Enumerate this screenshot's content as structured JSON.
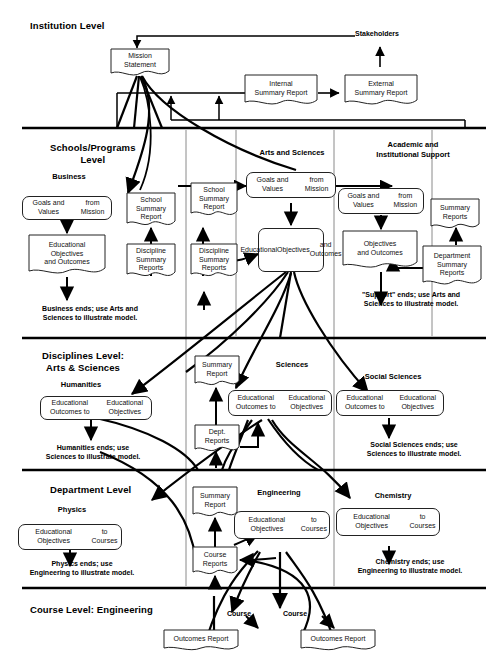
{
  "diagram": {
    "levels": [
      {
        "id": "institution",
        "label": "Institution Level"
      },
      {
        "id": "schools",
        "label": "Schools/Programs\nLevel",
        "line1": "Schools/Programs",
        "line2": "Level"
      },
      {
        "id": "disciplines",
        "label": "Disciplines Level:\nArts & Sciences",
        "line1": "Disciplines Level:",
        "line2": "Arts & Sciences"
      },
      {
        "id": "department",
        "label": "Department Level"
      },
      {
        "id": "course",
        "label": "Course Level:  Engineering"
      }
    ],
    "columns": [
      {
        "id": "business",
        "label": "Business"
      },
      {
        "id": "arts-and-sciences",
        "label": "Arts and Sciences"
      },
      {
        "id": "academic-support",
        "line1": "Academic and",
        "line2": "Institutional Support"
      },
      {
        "id": "humanities",
        "label": "Humanities"
      },
      {
        "id": "sciences",
        "label": "Sciences"
      },
      {
        "id": "social-sciences",
        "label": "Social Sciences"
      },
      {
        "id": "physics",
        "label": "Physics"
      },
      {
        "id": "engineering",
        "label": "Engineering"
      },
      {
        "id": "chemistry",
        "label": "Chemistry"
      }
    ],
    "nodes": {
      "mission_statement": "Mission\nStatement",
      "internal_summary_report": "Internal\nSummary Report",
      "external_summary_report": "External\nSummary Report",
      "business_goals": "Goals and Values\nfrom Mission",
      "business_school_summary": "School\nSummary\nReport",
      "business_edu_obj": "Educational\nObjectives\nand Outcomes",
      "business_discipline_summary": "Discipline\nSummary\nReports",
      "as_school_summary": "School\nSummary\nReport",
      "as_goals": "Goals and Values\nfrom Mission",
      "as_discipline_summary": "Discipline\nSummary\nReports",
      "as_edu_obj": "Educational\nObjectives\nand Outcomes",
      "sup_goals": "Goals and Values\nfrom Mission",
      "sup_summary_reports": "Summary\nReports",
      "sup_objectives": "Objectives\nand Outcomes",
      "sup_dept_summary": "Department\nSummary\nReports",
      "hum_outcomes": "Educational Outcomes to\nEducational Objectives",
      "sci_summary_report": "Summary\nReport",
      "sci_dept_reports": "Dept.\nReports",
      "sci_outcomes": "Educational Outcomes to\nEducational Objectives",
      "soc_outcomes": "Educational Outcomes to\nEducational Objectives",
      "phys_obj_courses": "Educational Objectives\nto Courses",
      "eng_summary_report": "Summary\nReport",
      "eng_course_reports": "Course\nReports",
      "eng_obj_courses": "Educational Objectives\nto Courses",
      "chem_obj_courses": "Educational Objectives\nto Courses",
      "outcomes_report_left": "Outcomes Report",
      "outcomes_report_right": "Outcomes Report"
    },
    "edge_labels": {
      "stakeholders": "Stakeholders",
      "course_left": "Course",
      "course_right": "Course"
    },
    "notes": {
      "business": "Business ends; use Arts and\nSciences to illustrate model.",
      "support": "\"Support\" ends; use Arts and\nSciences to illustrate model.",
      "humanities": "Humanities ends; use\nSciences to illustrate model.",
      "social_sciences": "Social Sciences ends; use\nSciences to illustrate model.",
      "physics": "Physics ends; use\nEngineering to illustrate model.",
      "chemistry": "Chemistry ends; use\nEngineering to illustrate model."
    },
    "colors": {
      "line": "#000000",
      "box_border": "#222222",
      "background": "#ffffff",
      "separator": "#000000",
      "thin_separator": "#7a7a7a"
    }
  }
}
